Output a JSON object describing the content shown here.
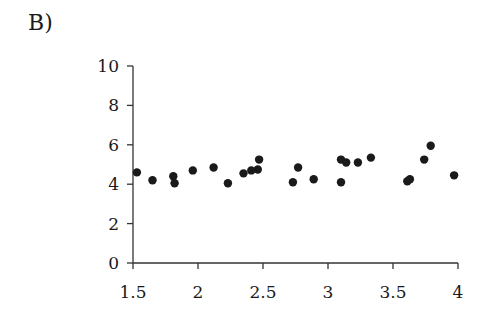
{
  "panel_label": "B)",
  "chart_data": {
    "type": "scatter",
    "title": "",
    "xlabel": "",
    "ylabel": "",
    "xlim": [
      1.5,
      4
    ],
    "ylim": [
      0,
      10
    ],
    "x_ticks": [
      "1.5",
      "2",
      "2.5",
      "3",
      "3.5",
      "4"
    ],
    "y_ticks": [
      "0",
      "2",
      "4",
      "6",
      "8",
      "10"
    ],
    "grid": false,
    "legend": null,
    "points": [
      {
        "x": 1.53,
        "y": 4.6
      },
      {
        "x": 1.65,
        "y": 4.2
      },
      {
        "x": 1.81,
        "y": 4.4
      },
      {
        "x": 1.82,
        "y": 4.05
      },
      {
        "x": 1.96,
        "y": 4.7
      },
      {
        "x": 2.12,
        "y": 4.85
      },
      {
        "x": 2.23,
        "y": 4.05
      },
      {
        "x": 2.35,
        "y": 4.55
      },
      {
        "x": 2.41,
        "y": 4.7
      },
      {
        "x": 2.46,
        "y": 4.75
      },
      {
        "x": 2.47,
        "y": 5.25
      },
      {
        "x": 2.73,
        "y": 4.1
      },
      {
        "x": 2.77,
        "y": 4.85
      },
      {
        "x": 2.89,
        "y": 4.25
      },
      {
        "x": 3.1,
        "y": 5.25
      },
      {
        "x": 3.1,
        "y": 4.1
      },
      {
        "x": 3.14,
        "y": 5.1
      },
      {
        "x": 3.23,
        "y": 5.1
      },
      {
        "x": 3.33,
        "y": 5.35
      },
      {
        "x": 3.61,
        "y": 4.15
      },
      {
        "x": 3.63,
        "y": 4.25
      },
      {
        "x": 3.74,
        "y": 5.25
      },
      {
        "x": 3.79,
        "y": 5.95
      },
      {
        "x": 3.97,
        "y": 4.45
      }
    ]
  }
}
